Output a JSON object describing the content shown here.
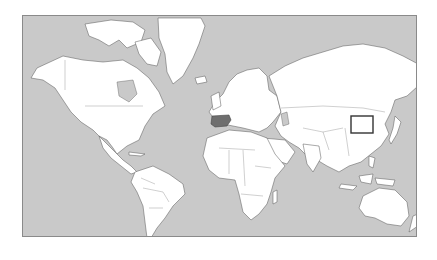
{
  "map": {
    "projection": "mercator-world",
    "ocean_color": "#c9c9c9",
    "land_color": "#ffffff",
    "border_color": "#555555",
    "highlighted_country": {
      "name": "Spain",
      "fill_color": "#6e6e6e"
    },
    "highlight_box": {
      "region": "Korean Peninsula",
      "stroke_color": "#333333"
    }
  }
}
